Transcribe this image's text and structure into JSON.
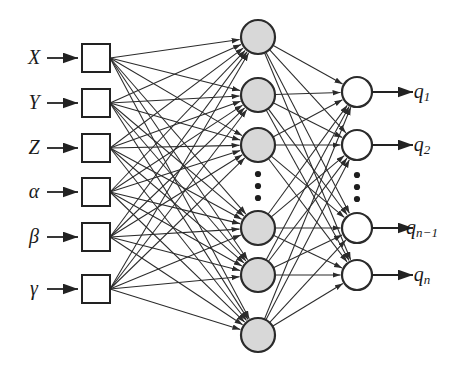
{
  "figure": {
    "type": "neural-network-diagram",
    "title": "",
    "background_color": "#ffffff"
  },
  "colors": {
    "hidden_node_fill": "#d8d8d8",
    "output_node_fill": "#ffffff",
    "input_box_fill": "#ffffff",
    "stroke": "#2b2b2b",
    "label_text": "#1a1a1a"
  },
  "layers": {
    "input": {
      "name": "input-layer",
      "shape": "square",
      "count": 6,
      "x": 96,
      "half": 14,
      "nodes": [
        {
          "label": "X",
          "sub": "",
          "y": 58
        },
        {
          "label": "Y",
          "sub": "",
          "y": 103
        },
        {
          "label": "Z",
          "sub": "",
          "y": 148
        },
        {
          "label": "α",
          "sub": "",
          "y": 192
        },
        {
          "label": "β",
          "sub": "",
          "y": 237
        },
        {
          "label": "γ",
          "sub": "",
          "y": 289
        }
      ]
    },
    "hidden": {
      "name": "hidden-layer",
      "shape": "circle",
      "count": 7,
      "x": 258,
      "r": 17,
      "ys": [
        37,
        95,
        145,
        228,
        275,
        335
      ],
      "ellipsis": {
        "x": 258,
        "ys": [
          174,
          186,
          198
        ],
        "r": 3.1
      }
    },
    "output": {
      "name": "output-layer",
      "shape": "circle",
      "count": 4,
      "x": 357,
      "r": 15,
      "nodes": [
        {
          "label": "q",
          "sub": "1",
          "y": 92
        },
        {
          "label": "q",
          "sub": "2",
          "y": 145
        },
        {
          "label": "q",
          "sub": "n−1",
          "y": 228
        },
        {
          "label": "q",
          "sub": "n",
          "y": 275
        }
      ],
      "ellipsis": {
        "x": 357,
        "ys": [
          175,
          187,
          199
        ],
        "r": 3.1
      }
    }
  },
  "input_labels": [
    "X",
    "Y",
    "Z",
    "α",
    "β",
    "γ"
  ],
  "output_labels": [
    "q₁",
    "q₂",
    "qₙ₋₁",
    "qₙ"
  ],
  "chart_data": {
    "type": "diagram",
    "input_nodes": [
      "X",
      "Y",
      "Z",
      "α",
      "β",
      "γ"
    ],
    "hidden_node_count": 7,
    "output_nodes": [
      "q_1",
      "q_2",
      "q_n-1",
      "q_n"
    ]
  }
}
